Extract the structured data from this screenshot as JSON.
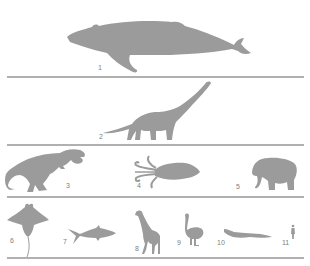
{
  "figure": {
    "silhouette_color": "#9b9b9b",
    "divider_color": "#b0b0b0",
    "rows": [
      {
        "items": [
          {
            "number": "1",
            "animal": "humpback whale"
          }
        ]
      },
      {
        "items": [
          {
            "number": "2",
            "animal": "sauropod dinosaur"
          }
        ]
      },
      {
        "items": [
          {
            "number": "3",
            "animal": "tyrannosaurus"
          },
          {
            "number": "4",
            "animal": "giant squid"
          },
          {
            "number": "5",
            "animal": "elephant"
          }
        ]
      },
      {
        "items": [
          {
            "number": "6",
            "animal": "manta ray"
          },
          {
            "number": "7",
            "animal": "shark"
          },
          {
            "number": "8",
            "animal": "giraffe"
          },
          {
            "number": "9",
            "animal": "ostrich"
          },
          {
            "number": "10",
            "animal": "crocodile"
          },
          {
            "number": "11",
            "animal": "human"
          }
        ]
      }
    ]
  }
}
